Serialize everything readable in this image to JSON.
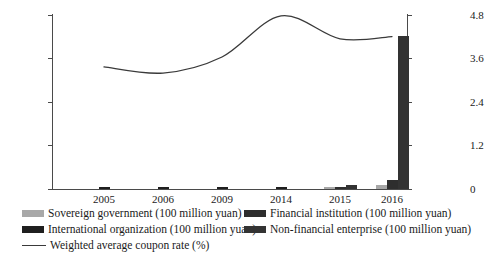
{
  "chart_data": {
    "type": "bar",
    "title": "",
    "subtitle": "",
    "xlabel": "",
    "ylabel": "",
    "y2label": "",
    "categories": [
      "2005",
      "2006",
      "2009",
      "2014",
      "2015",
      "2016"
    ],
    "ylim": [
      0,
      1200
    ],
    "yticks": [
      "0",
      "300",
      "600",
      "900",
      "1200"
    ],
    "y2lim": [
      0,
      4.8
    ],
    "y2ticks": [
      "0",
      "1.2",
      "2.4",
      "3.6",
      "4.8"
    ],
    "grid": false,
    "legend_position": "bottom",
    "series": [
      {
        "name": "Sovereign government (100 million yuan)",
        "color": "#a8a8a8",
        "axis": "left",
        "values": [
          0,
          0,
          0,
          0,
          12,
          30
        ]
      },
      {
        "name": "Financial institution (100 million yuan)",
        "color": "#2e2e2e",
        "axis": "left",
        "values": [
          0,
          0,
          0,
          0,
          14,
          65
        ]
      },
      {
        "name": "International organization (100 million yuan)",
        "color": "#1f1f1f",
        "axis": "left",
        "values": [
          16,
          10,
          10,
          10,
          0,
          0
        ]
      },
      {
        "name": "Non-financial enterprise (100 million yuan)",
        "color": "#333333",
        "axis": "left",
        "values": [
          0,
          0,
          0,
          0,
          30,
          1050
        ]
      }
    ],
    "line_series": {
      "name": "Weighted average coupon rate (%)",
      "color": "#3a3a3a",
      "axis": "right",
      "values": [
        3.35,
        3.18,
        3.62,
        4.75,
        4.12,
        4.18
      ]
    }
  },
  "axis": {
    "left": {
      "t0": "0",
      "t1": "300",
      "t2": "600",
      "t3": "900",
      "t4": "1200"
    },
    "right": {
      "t0": "0",
      "t1": "1.2",
      "t2": "2.4",
      "t3": "3.6",
      "t4": "4.8"
    },
    "x": {
      "c0": "2005",
      "c1": "2006",
      "c2": "2009",
      "c3": "2014",
      "c4": "2015",
      "c5": "2016"
    }
  },
  "legend": {
    "sovereign": "Sovereign government (100 million yuan)",
    "financial": "Financial institution (100 million yuan)",
    "international": "International organization (100 million yuan)",
    "nonfinancial": "Non-financial enterprise (100 million yuan)",
    "coupon": "Weighted average coupon rate (%)"
  }
}
